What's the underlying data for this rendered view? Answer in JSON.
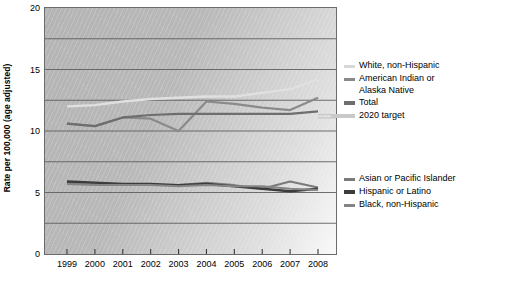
{
  "chart_data": {
    "type": "line",
    "title": "",
    "xlabel": "",
    "ylabel": "Rate per 100,000 (age adjusted)",
    "categories": [
      "1999",
      "2000",
      "2001",
      "2002",
      "2003",
      "2004",
      "2005",
      "2006",
      "2007",
      "2008"
    ],
    "x": [
      1999,
      2000,
      2001,
      2002,
      2003,
      2004,
      2005,
      2006,
      2007,
      2008
    ],
    "ylim": [
      0,
      20
    ],
    "yticks": [
      0,
      5,
      10,
      15,
      20
    ],
    "ytick_labels": [
      "0",
      "5",
      "10",
      "15",
      "20"
    ],
    "gridlines": [
      2.5,
      5,
      7.5,
      10,
      12.5,
      15,
      17.5
    ],
    "grid": true,
    "legend_position": "right",
    "series": [
      {
        "name": "White, non-Hispanic",
        "color": "#e0e0e0",
        "width": 2.4,
        "values": [
          12.0,
          12.1,
          12.4,
          12.6,
          12.7,
          12.8,
          12.8,
          13.1,
          13.4,
          14.2
        ]
      },
      {
        "name": "American Indian or Alaska Native",
        "color": "#8a8a8a",
        "width": 2.2,
        "values": [
          10.6,
          10.4,
          11.1,
          11.0,
          10.0,
          12.4,
          12.2,
          11.9,
          11.7,
          12.7
        ]
      },
      {
        "name": "Total",
        "color": "#6e6e6e",
        "width": 2.2,
        "values": [
          10.6,
          10.4,
          11.1,
          11.3,
          11.4,
          11.4,
          11.4,
          11.4,
          11.4,
          11.6
        ]
      },
      {
        "name": "Asian or Pacific Islander",
        "color": "#7a7a7a",
        "width": 2.0,
        "values": [
          5.8,
          5.7,
          5.7,
          5.6,
          5.6,
          5.8,
          5.6,
          5.3,
          5.9,
          5.4
        ]
      },
      {
        "name": "Hispanic or Latino",
        "color": "#3c3c3c",
        "width": 2.4,
        "values": [
          5.9,
          5.8,
          5.7,
          5.7,
          5.6,
          5.7,
          5.5,
          5.3,
          5.1,
          5.3
        ]
      },
      {
        "name": "Black, non-Hispanic",
        "color": "#858585",
        "width": 2.0,
        "values": [
          5.7,
          5.6,
          5.6,
          5.6,
          5.5,
          5.6,
          5.5,
          5.5,
          5.3,
          5.2
        ]
      }
    ],
    "reference_line": {
      "name": "2020 target",
      "value": 11.2,
      "color": "#c9c9c9",
      "style": "double",
      "x_start": 2008.0,
      "x_end": 2009.0
    }
  },
  "legend": {
    "upper": [
      {
        "label": "White, non-Hispanic",
        "color": "#d8d8d8",
        "thick": false
      },
      {
        "label": "American Indian or\nAlaska Native",
        "color": "#8a8a8a",
        "thick": false
      },
      {
        "label": "Total",
        "color": "#6e6e6e",
        "thick": true
      }
    ],
    "target": {
      "label": "2020 target",
      "color": "#c9c9c9"
    },
    "lower": [
      {
        "label": "Asian or Pacific Islander",
        "color": "#7a7a7a",
        "thick": false
      },
      {
        "label": "Hispanic or Latino",
        "color": "#3c3c3c",
        "thick": true
      },
      {
        "label": "Black, non-Hispanic",
        "color": "#858585",
        "thick": false
      }
    ]
  }
}
